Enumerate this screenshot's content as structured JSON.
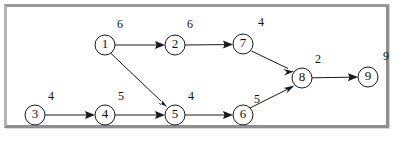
{
  "diagram": {
    "type": "directed-graph",
    "frame": {
      "border_color": "#9a9a9a",
      "background": "#ffffff"
    },
    "node_style": {
      "radius": 10,
      "fill": "#ffffff",
      "stroke": "#1a1a1a"
    },
    "nodes": [
      {
        "id": "1",
        "label": "1",
        "x": 105,
        "y": 45
      },
      {
        "id": "2",
        "label": "2",
        "x": 175,
        "y": 45
      },
      {
        "id": "3",
        "label": "3",
        "x": 35,
        "y": 115
      },
      {
        "id": "4",
        "label": "4",
        "x": 105,
        "y": 115
      },
      {
        "id": "5",
        "label": "5",
        "x": 175,
        "y": 115
      },
      {
        "id": "6",
        "label": "6",
        "x": 243,
        "y": 115
      },
      {
        "id": "7",
        "label": "7",
        "x": 243,
        "y": 44
      },
      {
        "id": "8",
        "label": "8",
        "x": 302,
        "y": 78
      },
      {
        "id": "9",
        "label": "9",
        "x": 368,
        "y": 77
      }
    ],
    "edges": [
      {
        "from": "1",
        "to": "2",
        "weight": "6",
        "label_x": 120,
        "label_y": 25
      },
      {
        "from": "2",
        "to": "7",
        "weight": "6",
        "label_x": 190,
        "label_y": 25
      },
      {
        "from": "7",
        "to": "8",
        "weight": "4",
        "label_x": 261,
        "label_y": 23
      },
      {
        "from": "8",
        "to": "9",
        "weight": "2",
        "label_x": 318,
        "label_y": 60
      },
      {
        "from": "1",
        "to": "5",
        "weight": "",
        "label_x": 0,
        "label_y": 0
      },
      {
        "from": "3",
        "to": "4",
        "weight": "4",
        "label_x": 51,
        "label_y": 97
      },
      {
        "from": "4",
        "to": "5",
        "weight": "5",
        "label_x": 121,
        "label_y": 97
      },
      {
        "from": "5",
        "to": "6",
        "weight": "4",
        "label_x": 191,
        "label_y": 97
      },
      {
        "from": "6",
        "to": "8",
        "weight": "5",
        "label_x": 257,
        "label_y": 100
      }
    ],
    "annotations": [
      {
        "text": "9",
        "x": 386,
        "y": 57,
        "name": "node-9-outer-label"
      }
    ]
  }
}
